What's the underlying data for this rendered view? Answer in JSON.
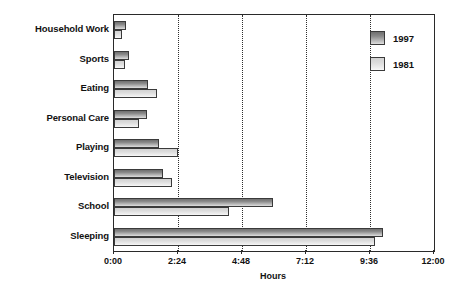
{
  "chart_data": {
    "type": "bar",
    "orientation": "horizontal",
    "title": "",
    "xlabel": "Hours",
    "ylabel": "",
    "xlim": [
      0,
      12
    ],
    "grid": true,
    "legend_position": "top-right",
    "xtick_labels": [
      "0:00",
      "2:24",
      "4:48",
      "7:12",
      "9:36",
      "12:00"
    ],
    "xtick_values": [
      0,
      2.4,
      4.8,
      7.2,
      9.6,
      12
    ],
    "categories": [
      "Household Work",
      "Sports",
      "Eating",
      "Personal Care",
      "Playing",
      "Television",
      "School",
      "Sleeping"
    ],
    "series": [
      {
        "name": "1997",
        "color": "#8a8a8a",
        "values": [
          0.45,
          0.55,
          1.27,
          1.25,
          1.7,
          1.85,
          5.95,
          10.1
        ]
      },
      {
        "name": "1981",
        "color": "#dcdcdc",
        "values": [
          0.3,
          0.4,
          1.6,
          0.95,
          2.4,
          2.18,
          4.3,
          9.8
        ]
      }
    ]
  },
  "legend": {
    "entries": [
      {
        "label": "1997",
        "swatch": "legend-swatch-1997"
      },
      {
        "label": "1981",
        "swatch": "legend-swatch-1981"
      }
    ]
  }
}
